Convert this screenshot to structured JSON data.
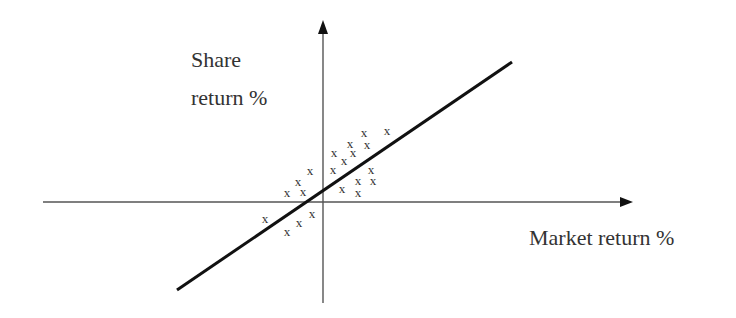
{
  "diagram": {
    "title": "",
    "type": "scatter-with-regression-line",
    "labels": {
      "y_axis_line1": "Share",
      "y_axis_line2": "return %",
      "x_axis": "Market return %"
    },
    "marker_glyph": "x",
    "colors": {
      "axis": "#555555",
      "arrowhead": "#111111",
      "line": "#111111",
      "text": "#333333",
      "background": "#ffffff"
    },
    "geometry": {
      "x_axis": {
        "x1": 43,
        "y1": 202,
        "x2": 622,
        "y2": 202,
        "tip_x": 633
      },
      "y_axis": {
        "x1": 323,
        "y1": 303,
        "x2": 323,
        "y2": 32,
        "tip_y": 20
      },
      "regression_line": {
        "x1": 177,
        "y1": 290,
        "x2": 512,
        "y2": 62
      },
      "label_positions": {
        "y_axis_line1": {
          "x": 191,
          "y": 67
        },
        "y_axis_line2": {
          "x": 191,
          "y": 105
        },
        "x_axis": {
          "x": 529,
          "y": 245
        }
      }
    },
    "points": [
      {
        "x": 364,
        "y": 133
      },
      {
        "x": 387,
        "y": 131
      },
      {
        "x": 350,
        "y": 144
      },
      {
        "x": 367,
        "y": 145
      },
      {
        "x": 334,
        "y": 153
      },
      {
        "x": 353,
        "y": 153
      },
      {
        "x": 344,
        "y": 161
      },
      {
        "x": 333,
        "y": 170
      },
      {
        "x": 371,
        "y": 170
      },
      {
        "x": 358,
        "y": 181
      },
      {
        "x": 373,
        "y": 181
      },
      {
        "x": 342,
        "y": 189
      },
      {
        "x": 358,
        "y": 193
      },
      {
        "x": 310,
        "y": 171
      },
      {
        "x": 298,
        "y": 182
      },
      {
        "x": 287,
        "y": 193
      },
      {
        "x": 303,
        "y": 192
      },
      {
        "x": 265,
        "y": 219
      },
      {
        "x": 312,
        "y": 214
      },
      {
        "x": 299,
        "y": 223
      },
      {
        "x": 287,
        "y": 232
      }
    ]
  }
}
